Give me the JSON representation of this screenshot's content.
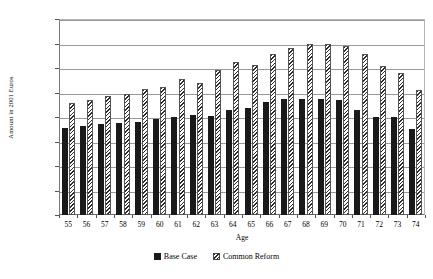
{
  "chart_data": {
    "type": "bar",
    "title": "",
    "xlabel": "Age",
    "ylabel": "Amount in 2001 Euros",
    "categories": [
      "55",
      "56",
      "57",
      "58",
      "59",
      "60",
      "61",
      "62",
      "63",
      "64",
      "65",
      "66",
      "67",
      "68",
      "69",
      "70",
      "71",
      "72",
      "73",
      "74"
    ],
    "series": [
      {
        "name": "Base Case",
        "values": [
          178000,
          181000,
          185000,
          188000,
          190000,
          196000,
          201000,
          205000,
          203000,
          215000,
          219000,
          231000,
          236000,
          237000,
          236000,
          235000,
          214000,
          201000,
          200000,
          175000
        ]
      },
      {
        "name": "Common Reform",
        "values": [
          229000,
          235000,
          243000,
          247000,
          258000,
          262000,
          277000,
          270000,
          295000,
          312000,
          307000,
          328000,
          341000,
          348000,
          350000,
          345000,
          328000,
          305000,
          289000,
          256000
        ]
      }
    ],
    "ylim": [
      0,
      400000
    ],
    "ytick_values": [
      0,
      50000,
      100000,
      150000,
      200000,
      250000,
      300000,
      350000,
      400000
    ],
    "ytick_labels": [
      "0",
      "50,000",
      "100,000",
      "150,000",
      "200,000",
      "250,000",
      "300,000",
      "350,000",
      "400,000"
    ],
    "grid": true,
    "legend_position": "bottom",
    "colors": {
      "base_case": "#1a1a1a",
      "common_reform": "#ffffff",
      "hatch_color": "#2b2b2b",
      "gridline": "#9a9a9a",
      "axis": "#555555"
    }
  }
}
